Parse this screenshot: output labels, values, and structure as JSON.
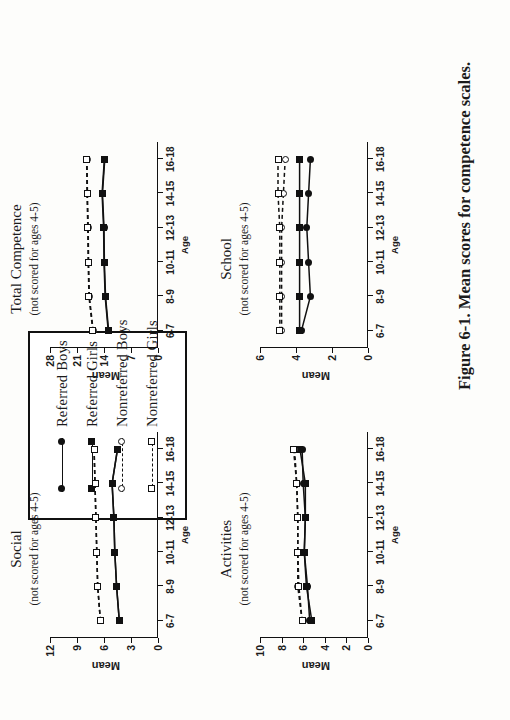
{
  "figure": {
    "caption": "Figure 6-1. Mean scores for competence scales.",
    "legend_box": {
      "entries": [
        {
          "label": "Referred Boys",
          "marker": "filled-circle",
          "line": "solid"
        },
        {
          "label": "Referred Girls",
          "marker": "filled-square",
          "line": "solid"
        },
        {
          "label": "Nonreferred Boys",
          "marker": "open-circle",
          "line": "dashed"
        },
        {
          "label": "Nonreferred Girls",
          "marker": "open-square",
          "line": "dashed"
        }
      ]
    }
  },
  "chart_data": [
    {
      "type": "line",
      "title": "Activities",
      "subtitle": "(not scored for ages 4-5)",
      "xlabel": "Age",
      "ylabel": "Mean",
      "categories": [
        "6-7",
        "8-9",
        "10-11",
        "12-13",
        "14-15",
        "16-18"
      ],
      "yticks": [
        0,
        2,
        4,
        6,
        8,
        10
      ],
      "ylim": [
        0,
        10
      ],
      "grid": false,
      "legend_position": "external",
      "series": [
        {
          "name": "Referred Boys",
          "marker": "filled-circle",
          "line": "solid",
          "values": [
            5.4,
            5.6,
            5.9,
            5.8,
            6.0,
            6.1
          ]
        },
        {
          "name": "Referred Girls",
          "marker": "filled-square",
          "line": "solid",
          "values": [
            5.2,
            5.7,
            5.9,
            5.8,
            5.8,
            6.3
          ]
        },
        {
          "name": "Nonreferred Boys",
          "marker": "open-circle",
          "line": "dashed",
          "values": [
            6.1,
            6.5,
            6.5,
            6.5,
            6.6,
            6.8
          ]
        },
        {
          "name": "Nonreferred Girls",
          "marker": "open-square",
          "line": "dashed",
          "values": [
            6.1,
            6.4,
            6.5,
            6.5,
            6.6,
            6.9
          ]
        }
      ]
    },
    {
      "type": "line",
      "title": "Social",
      "subtitle": "(not scored for ages 4-5)",
      "xlabel": "Age",
      "ylabel": "Mean",
      "categories": [
        "6-7",
        "8-9",
        "10-11",
        "12-13",
        "14-15",
        "16-18"
      ],
      "yticks": [
        0,
        3,
        6,
        9,
        12
      ],
      "ylim": [
        0,
        12
      ],
      "grid": false,
      "legend_position": "external",
      "series": [
        {
          "name": "Referred Boys",
          "marker": "filled-circle",
          "line": "solid",
          "values": [
            4.3,
            4.6,
            4.8,
            4.9,
            5.1,
            4.5
          ]
        },
        {
          "name": "Referred Girls",
          "marker": "filled-square",
          "line": "solid",
          "values": [
            4.3,
            4.6,
            4.8,
            4.9,
            5.1,
            4.5
          ]
        },
        {
          "name": "Nonreferred Boys",
          "marker": "open-circle",
          "line": "dashed",
          "values": [
            6.4,
            6.7,
            6.8,
            6.9,
            7.0,
            7.1
          ]
        },
        {
          "name": "Nonreferred Girls",
          "marker": "open-square",
          "line": "dashed",
          "values": [
            6.4,
            6.7,
            6.8,
            6.9,
            7.0,
            7.1
          ]
        }
      ]
    },
    {
      "type": "line",
      "title": "School",
      "subtitle": "(not scored for ages 4-5)",
      "xlabel": "Age",
      "ylabel": "Mean",
      "categories": [
        "6-7",
        "8-9",
        "10-11",
        "12-13",
        "14-15",
        "16-18"
      ],
      "yticks": [
        0,
        2,
        4,
        6
      ],
      "ylim": [
        0,
        6
      ],
      "grid": false,
      "legend_position": "external",
      "series": [
        {
          "name": "Referred Boys",
          "marker": "filled-circle",
          "line": "solid",
          "values": [
            3.7,
            3.2,
            3.3,
            3.4,
            3.3,
            3.2
          ]
        },
        {
          "name": "Referred Girls",
          "marker": "filled-square",
          "line": "solid",
          "values": [
            3.8,
            3.8,
            3.8,
            3.8,
            3.8,
            3.8
          ]
        },
        {
          "name": "Nonreferred Boys",
          "marker": "open-circle",
          "line": "dashed",
          "values": [
            4.8,
            4.8,
            4.8,
            4.8,
            4.7,
            4.6
          ]
        },
        {
          "name": "Nonreferred Girls",
          "marker": "open-square",
          "line": "dashed",
          "values": [
            4.9,
            4.9,
            4.9,
            4.9,
            5.0,
            5.0
          ]
        }
      ]
    },
    {
      "type": "line",
      "title": "Total Competence",
      "subtitle": "(not scored for ages 4-5)",
      "xlabel": "Age",
      "ylabel": "Mean",
      "categories": [
        "6-7",
        "8-9",
        "10-11",
        "12-13",
        "14-15",
        "16-18"
      ],
      "yticks": [
        0,
        7,
        14,
        21,
        28
      ],
      "ylim": [
        0,
        28
      ],
      "grid": false,
      "legend_position": "external",
      "series": [
        {
          "name": "Referred Boys",
          "marker": "filled-circle",
          "line": "solid",
          "values": [
            12.8,
            13.6,
            13.9,
            14.0,
            14.4,
            13.8
          ]
        },
        {
          "name": "Referred Girls",
          "marker": "filled-square",
          "line": "solid",
          "values": [
            12.9,
            13.7,
            14.0,
            14.1,
            14.5,
            13.9
          ]
        },
        {
          "name": "Nonreferred Boys",
          "marker": "open-circle",
          "line": "dashed",
          "values": [
            16.8,
            17.8,
            18.0,
            18.1,
            18.3,
            18.4
          ]
        },
        {
          "name": "Nonreferred Girls",
          "marker": "open-square",
          "line": "dashed",
          "values": [
            16.9,
            17.9,
            18.1,
            18.2,
            18.4,
            18.5
          ]
        }
      ]
    }
  ]
}
